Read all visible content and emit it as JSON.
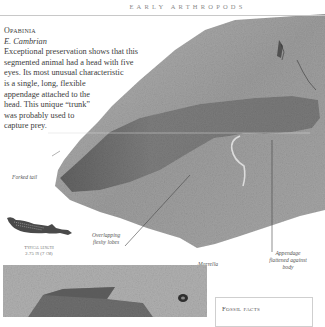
{
  "header": {
    "title": "EARLY ARTHROPODS"
  },
  "intro": {
    "name": "Opabinia",
    "era": "E. Cambrian",
    "lines": [
      "Exceptional preservation shows that this",
      "segmented animal had a head with five",
      "eyes. Its most unusual characteristic",
      "is a single, long, flexible",
      "appendage attached to the",
      "head. This unique “trunk”",
      "was probably used to",
      "capture prey."
    ]
  },
  "labels": {
    "forked_tail": "Forked tail",
    "overlapping_1": "Overlapping",
    "overlapping_2": "fleshy lobes",
    "appendage_1": "Appendage",
    "appendage_2": "flattened against",
    "appendage_3": "body",
    "marrella": "Marrella"
  },
  "length_caption": {
    "line1": "Typical length",
    "line2": "2.75 in (7 cm)"
  },
  "fossil_facts": {
    "title": "Fossil facts"
  },
  "colors": {
    "rock_light": "#a8a8a8",
    "rock_mid": "#8e8e8e",
    "fossil_dark": "#6e6e6e",
    "rule": "#c8c8c8"
  }
}
